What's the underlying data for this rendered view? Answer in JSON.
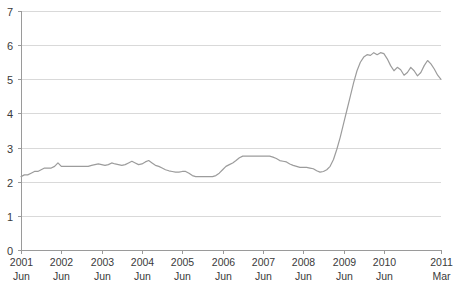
{
  "chart_data": {
    "type": "line",
    "title": "",
    "subtitle": "",
    "xlabel": "",
    "ylabel": "",
    "ylim": [
      0,
      7
    ],
    "y_ticks": [
      0,
      1,
      2,
      3,
      4,
      5,
      6,
      7
    ],
    "grid": true,
    "legend": "none",
    "line_color": "#9c9c9c",
    "grid_color": "#d9d9d9",
    "axis_color": "#9a9a9a",
    "text_color": "#3a3a3a",
    "x_tick_labels": [
      {
        "year": "2001",
        "month": "Jun"
      },
      {
        "year": "2002",
        "month": "Jun"
      },
      {
        "year": "2003",
        "month": "Jun"
      },
      {
        "year": "2004",
        "month": "Jun"
      },
      {
        "year": "2005",
        "month": "Jun"
      },
      {
        "year": "2006",
        "month": "Jun"
      },
      {
        "year": "2007",
        "month": "Jun"
      },
      {
        "year": "2008",
        "month": "Jun"
      },
      {
        "year": "2009",
        "month": "Jun"
      },
      {
        "year": "2010",
        "month": "Jun"
      },
      {
        "year": "2011",
        "month": "Mar"
      }
    ],
    "x_start_label": "2001 Jun",
    "x_end_label": "2011 Mar",
    "series": [
      {
        "name": "rate",
        "values": [
          2.15,
          2.2,
          2.2,
          2.25,
          2.3,
          2.3,
          2.35,
          2.4,
          2.4,
          2.4,
          2.45,
          2.55,
          2.45,
          2.45,
          2.45,
          2.45,
          2.45,
          2.45,
          2.45,
          2.45,
          2.45,
          2.48,
          2.5,
          2.52,
          2.5,
          2.48,
          2.5,
          2.55,
          2.52,
          2.5,
          2.48,
          2.5,
          2.55,
          2.6,
          2.55,
          2.5,
          2.52,
          2.58,
          2.62,
          2.55,
          2.48,
          2.45,
          2.4,
          2.35,
          2.32,
          2.3,
          2.28,
          2.28,
          2.3,
          2.3,
          2.25,
          2.18,
          2.15,
          2.15,
          2.15,
          2.15,
          2.15,
          2.15,
          2.18,
          2.25,
          2.35,
          2.45,
          2.5,
          2.55,
          2.62,
          2.7,
          2.75,
          2.75,
          2.75,
          2.75,
          2.75,
          2.75,
          2.75,
          2.75,
          2.75,
          2.72,
          2.68,
          2.62,
          2.6,
          2.58,
          2.52,
          2.48,
          2.45,
          2.42,
          2.42,
          2.42,
          2.4,
          2.38,
          2.32,
          2.28,
          2.3,
          2.35,
          2.45,
          2.65,
          2.95,
          3.3,
          3.7,
          4.1,
          4.5,
          4.9,
          5.25,
          5.5,
          5.65,
          5.72,
          5.7,
          5.78,
          5.72,
          5.78,
          5.75,
          5.6,
          5.4,
          5.25,
          5.35,
          5.28,
          5.12,
          5.2,
          5.35,
          5.25,
          5.1,
          5.2,
          5.4,
          5.55,
          5.45,
          5.3,
          5.12,
          5.0
        ]
      }
    ],
    "n_points": 126,
    "value_min": 2.15,
    "value_max": 5.78,
    "value_start": 2.15,
    "value_end": 5.0
  },
  "axes": {
    "plot_left": 21,
    "plot_right": 441,
    "plot_top": 11,
    "plot_bottom": 250
  }
}
